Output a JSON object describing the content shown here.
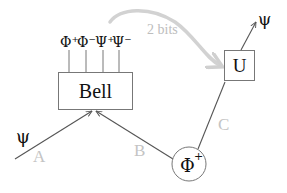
{
  "diagram": {
    "colors": {
      "line": "#555555",
      "text": "#111111",
      "faint": "#c8c8c8",
      "faint_text": "#b8b8b8",
      "box_stroke": "#777777"
    },
    "input_state": "ψ",
    "output_state": "ψ",
    "bell_box": {
      "label": "Bell",
      "outcomes": [
        "Φ⁺",
        "Φ⁻",
        "Ψ⁺",
        "Ψ⁻"
      ]
    },
    "unitary_box": {
      "label": "U"
    },
    "entangled_source": {
      "label": "Φ",
      "superscript": "+"
    },
    "channels": {
      "a": "A",
      "b": "B",
      "c": "C"
    },
    "classical_link": {
      "label": "2 bits"
    }
  }
}
